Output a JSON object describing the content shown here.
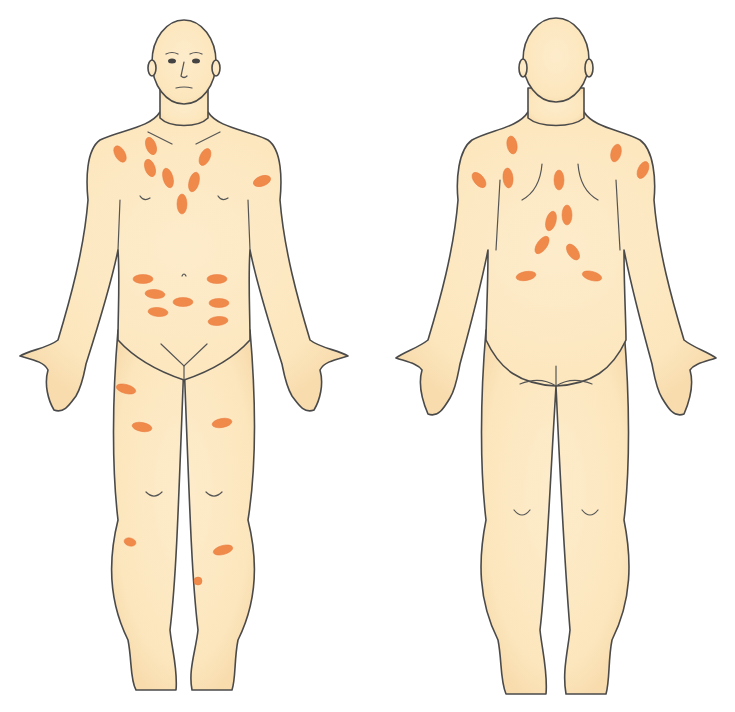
{
  "figure": {
    "title": "",
    "views": [
      "front",
      "back"
    ],
    "colors": {
      "skin": "#fdedc8",
      "skin_shadow": "#f6d6a6",
      "outline": "#4a4a4a",
      "lesion": "#f08a4b"
    }
  },
  "lesions": {
    "front": [
      {
        "cx": 120,
        "cy": 154,
        "rx": 5,
        "ry": 9,
        "rot": -30
      },
      {
        "cx": 151,
        "cy": 146,
        "rx": 5,
        "ry": 9,
        "rot": -20
      },
      {
        "cx": 150,
        "cy": 168,
        "rx": 5,
        "ry": 9,
        "rot": -20
      },
      {
        "cx": 168,
        "cy": 178,
        "rx": 5,
        "ry": 10,
        "rot": -15
      },
      {
        "cx": 205,
        "cy": 157,
        "rx": 5,
        "ry": 9,
        "rot": 25
      },
      {
        "cx": 194,
        "cy": 182,
        "rx": 5,
        "ry": 10,
        "rot": 15
      },
      {
        "cx": 182,
        "cy": 204,
        "rx": 5,
        "ry": 10,
        "rot": 0
      },
      {
        "cx": 262,
        "cy": 181,
        "rx": 9,
        "ry": 5,
        "rot": -20
      },
      {
        "cx": 143,
        "cy": 279,
        "rx": 10,
        "ry": 4.5,
        "rot": 0
      },
      {
        "cx": 217,
        "cy": 279,
        "rx": 10,
        "ry": 4.5,
        "rot": 0
      },
      {
        "cx": 155,
        "cy": 294,
        "rx": 10,
        "ry": 4.5,
        "rot": 5
      },
      {
        "cx": 183,
        "cy": 302,
        "rx": 10,
        "ry": 4.5,
        "rot": 0
      },
      {
        "cx": 219,
        "cy": 303,
        "rx": 10,
        "ry": 4.5,
        "rot": 0
      },
      {
        "cx": 158,
        "cy": 312,
        "rx": 10,
        "ry": 4.5,
        "rot": 5
      },
      {
        "cx": 218,
        "cy": 321,
        "rx": 10,
        "ry": 4.5,
        "rot": -5
      },
      {
        "cx": 126,
        "cy": 389,
        "rx": 10,
        "ry": 4.5,
        "rot": 15
      },
      {
        "cx": 142,
        "cy": 427,
        "rx": 10,
        "ry": 4.5,
        "rot": 10
      },
      {
        "cx": 222,
        "cy": 423,
        "rx": 10,
        "ry": 4.5,
        "rot": -10
      },
      {
        "cx": 130,
        "cy": 542,
        "rx": 6,
        "ry": 4,
        "rot": 15
      },
      {
        "cx": 223,
        "cy": 550,
        "rx": 10,
        "ry": 4.5,
        "rot": -15
      },
      {
        "cx": 198,
        "cy": 581,
        "rx": 4,
        "ry": 4,
        "rot": 0
      }
    ],
    "back": [
      {
        "cx": 512,
        "cy": 145,
        "rx": 5,
        "ry": 9,
        "rot": -10
      },
      {
        "cx": 616,
        "cy": 153,
        "rx": 5,
        "ry": 9,
        "rot": 15
      },
      {
        "cx": 479,
        "cy": 180,
        "rx": 5,
        "ry": 9,
        "rot": -40
      },
      {
        "cx": 508,
        "cy": 178,
        "rx": 5,
        "ry": 10,
        "rot": -5
      },
      {
        "cx": 559,
        "cy": 180,
        "rx": 5,
        "ry": 10,
        "rot": 0
      },
      {
        "cx": 643,
        "cy": 170,
        "rx": 5,
        "ry": 9,
        "rot": 25
      },
      {
        "cx": 551,
        "cy": 221,
        "rx": 5,
        "ry": 10,
        "rot": 15
      },
      {
        "cx": 567,
        "cy": 215,
        "rx": 5,
        "ry": 10,
        "rot": 0
      },
      {
        "cx": 542,
        "cy": 245,
        "rx": 5,
        "ry": 10,
        "rot": 35
      },
      {
        "cx": 573,
        "cy": 252,
        "rx": 5,
        "ry": 9,
        "rot": -35
      },
      {
        "cx": 526,
        "cy": 276,
        "rx": 10,
        "ry": 4.5,
        "rot": -10
      },
      {
        "cx": 592,
        "cy": 276,
        "rx": 10,
        "ry": 4.5,
        "rot": 15
      }
    ]
  }
}
